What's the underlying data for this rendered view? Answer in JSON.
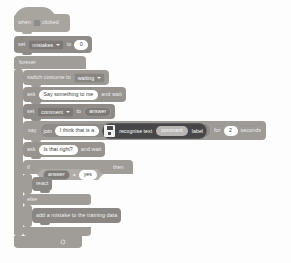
{
  "program": {
    "title": "Scratch machine-learning script",
    "blocks": {
      "when_flag_clicked": {
        "word_when": "when",
        "flag_icon": "green-flag-icon",
        "word_clicked": "clicked"
      },
      "set_mistakes": {
        "word_set": "set",
        "variable": "mistakes",
        "word_to": "to",
        "value": "0"
      },
      "forever": {
        "label": "forever",
        "loop_icon": "loop-arrow-icon"
      },
      "switch_costume": {
        "label": "switch costume to",
        "costume": "waiting"
      },
      "ask_1": {
        "word_ask": "ask",
        "question": "Say something to me",
        "word_and_wait": "and wait"
      },
      "set_comment": {
        "word_set": "set",
        "variable": "comment",
        "word_to": "to",
        "value": "answer"
      },
      "say_for_seconds": {
        "word_say": "say",
        "word_join": "join",
        "join_text": "I think that is a",
        "ml_icon": "machine-learning-for-kids-icon",
        "ml_label": "recognise text",
        "ml_input": "comment",
        "ml_output": "label",
        "word_for": "for",
        "seconds_value": "2",
        "word_seconds": "seconds"
      },
      "ask_2": {
        "word_ask": "ask",
        "question": "Is that right?",
        "word_and_wait": "and wait"
      },
      "if_else": {
        "word_if": "if",
        "operand_left": "answer",
        "operator": "=",
        "operand_right": "yes",
        "word_then": "then",
        "word_else": "else"
      },
      "react": {
        "label": "react"
      },
      "add_mistake": {
        "label": "add a mistake to the training data"
      }
    }
  },
  "colors": {
    "events": "#a8a49e",
    "control": "#a09c97",
    "looks": "#9e9a96",
    "sensing": "#97938f",
    "variables": "#8f8b88",
    "machine_learning": "#47474a",
    "custom_block": "#8a8784",
    "canvas": "#fdfdfd"
  }
}
